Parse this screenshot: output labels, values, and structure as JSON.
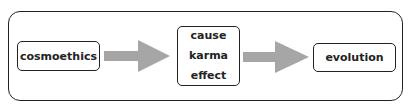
{
  "diagram": {
    "nodes": [
      {
        "id": "cosmoethics",
        "lines": [
          "cosmoethics"
        ]
      },
      {
        "id": "cause-karma-effect",
        "lines": [
          "cause",
          "karma",
          "effect"
        ]
      },
      {
        "id": "evolution",
        "lines": [
          "evolution"
        ]
      }
    ],
    "edges": [
      {
        "from": "cosmoethics",
        "to": "cause-karma-effect"
      },
      {
        "from": "cause-karma-effect",
        "to": "evolution"
      }
    ],
    "colors": {
      "arrow": "#a6a6a6",
      "border": "#222222"
    }
  }
}
